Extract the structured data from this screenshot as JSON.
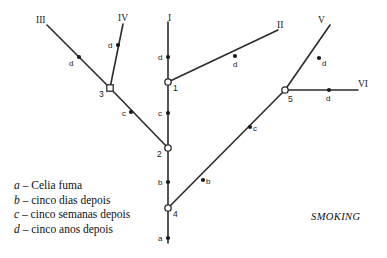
{
  "diagram": {
    "title_caption": "SMOKING",
    "stroke_color": "#2b2b2b",
    "node_fill_color": "#ffffff",
    "marker_fill_color": "#1a1a1a",
    "branch_labels": [
      {
        "id": "branch-label-i",
        "text": "I",
        "x": 168,
        "y": 14
      },
      {
        "id": "branch-label-ii",
        "text": "II",
        "x": 277,
        "y": 21
      },
      {
        "id": "branch-label-iii",
        "text": "III",
        "x": 36,
        "y": 16
      },
      {
        "id": "branch-label-iv",
        "text": "IV",
        "x": 118,
        "y": 14
      },
      {
        "id": "branch-label-v",
        "text": "V",
        "x": 318,
        "y": 16
      },
      {
        "id": "branch-label-vi",
        "text": "VI",
        "x": 358,
        "y": 80
      }
    ],
    "nodes": [
      {
        "id": "node-1",
        "label": "1",
        "shape": "circle",
        "cx": 168,
        "cy": 82,
        "label_x": 173,
        "label_y": 84
      },
      {
        "id": "node-2",
        "label": "2",
        "shape": "circle",
        "cx": 168,
        "cy": 148,
        "label_x": 157,
        "label_y": 150
      },
      {
        "id": "node-3",
        "label": "3",
        "shape": "square",
        "cx": 110,
        "cy": 88,
        "label_x": 99,
        "label_y": 90
      },
      {
        "id": "node-4",
        "label": "4",
        "shape": "circle",
        "cx": 168,
        "cy": 208,
        "label_x": 173,
        "label_y": 210
      },
      {
        "id": "node-5",
        "label": "5",
        "shape": "circle",
        "cx": 285,
        "cy": 90,
        "label_x": 288,
        "label_y": 95
      }
    ],
    "edges": [
      {
        "id": "edge-trunk-a-to-4",
        "x1": 168,
        "y1": 243,
        "x2": 168,
        "y2": 208
      },
      {
        "id": "edge-4-to-2",
        "x1": 168,
        "y1": 208,
        "x2": 168,
        "y2": 148
      },
      {
        "id": "edge-2-to-1",
        "x1": 168,
        "y1": 148,
        "x2": 168,
        "y2": 82
      },
      {
        "id": "edge-1-to-i",
        "x1": 168,
        "y1": 82,
        "x2": 168,
        "y2": 22
      },
      {
        "id": "edge-1-to-ii",
        "x1": 168,
        "y1": 82,
        "x2": 278,
        "y2": 30
      },
      {
        "id": "edge-2-to-3",
        "x1": 168,
        "y1": 148,
        "x2": 110,
        "y2": 88
      },
      {
        "id": "edge-3-to-iii",
        "x1": 110,
        "y1": 88,
        "x2": 47,
        "y2": 25
      },
      {
        "id": "edge-3-to-iv",
        "x1": 110,
        "y1": 88,
        "x2": 123,
        "y2": 24
      },
      {
        "id": "edge-4-to-5",
        "x1": 168,
        "y1": 208,
        "x2": 285,
        "y2": 90
      },
      {
        "id": "edge-5-to-v",
        "x1": 285,
        "y1": 90,
        "x2": 330,
        "y2": 25
      },
      {
        "id": "edge-5-to-vi",
        "x1": 285,
        "y1": 90,
        "x2": 358,
        "y2": 90
      }
    ],
    "event_markers": [
      {
        "id": "marker-a-trunk",
        "label": "a",
        "cx": 168,
        "cy": 238,
        "label_x": 158,
        "label_y": 235
      },
      {
        "id": "marker-b-trunk",
        "label": "b",
        "cx": 168,
        "cy": 182,
        "label_x": 158,
        "label_y": 179
      },
      {
        "id": "marker-b-branch-45",
        "label": "b",
        "cx": 203,
        "cy": 180,
        "label_x": 206,
        "label_y": 178
      },
      {
        "id": "marker-c-trunk",
        "label": "c",
        "cx": 168,
        "cy": 113,
        "label_x": 158,
        "label_y": 110
      },
      {
        "id": "marker-c-branch-23",
        "label": "c",
        "cx": 131,
        "cy": 112,
        "label_x": 122,
        "label_y": 110
      },
      {
        "id": "marker-c-branch-45",
        "label": "c",
        "cx": 250,
        "cy": 127,
        "label_x": 253,
        "label_y": 125
      },
      {
        "id": "marker-d-trunk",
        "label": "d",
        "cx": 168,
        "cy": 57,
        "label_x": 158,
        "label_y": 54
      },
      {
        "id": "marker-d-branch-ii",
        "label": "d",
        "cx": 235,
        "cy": 56,
        "label_x": 233,
        "label_y": 61
      },
      {
        "id": "marker-d-branch-iii",
        "label": "d",
        "cx": 79,
        "cy": 57,
        "label_x": 69,
        "label_y": 60
      },
      {
        "id": "marker-d-branch-iv",
        "label": "d",
        "cx": 118,
        "cy": 45,
        "label_x": 108,
        "label_y": 42
      },
      {
        "id": "marker-d-branch-v",
        "label": "d",
        "cx": 319,
        "cy": 58,
        "label_x": 322,
        "label_y": 60
      },
      {
        "id": "marker-d-branch-vi",
        "label": "d",
        "cx": 329,
        "cy": 90,
        "label_x": 326,
        "label_y": 95
      }
    ],
    "legend": [
      {
        "key": "a",
        "dash": "–",
        "text": "Celia fuma"
      },
      {
        "key": "b",
        "dash": "–",
        "text": "cinco dias depois"
      },
      {
        "key": "c",
        "dash": "–",
        "text": "cinco semanas depois"
      },
      {
        "key": "d",
        "dash": "–",
        "text": "cinco anos depois"
      }
    ]
  }
}
